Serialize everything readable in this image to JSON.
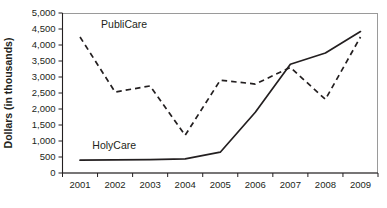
{
  "chart_data": {
    "type": "line",
    "title": "",
    "xlabel": "",
    "ylabel": "Dollars (in thousands)",
    "categories": [
      "2001",
      "2002",
      "2003",
      "2004",
      "2005",
      "2006",
      "2007",
      "2008",
      "2009"
    ],
    "ylim": [
      0,
      5000
    ],
    "yticks": [
      0,
      500,
      1000,
      1500,
      2000,
      2500,
      3000,
      3500,
      4000,
      4500,
      5000
    ],
    "ytick_labels": [
      "0",
      "500",
      "1,000",
      "1,500",
      "2,000",
      "2,500",
      "3,000",
      "3,500",
      "4,000",
      "4,500",
      "5,000"
    ],
    "grid": false,
    "legend_position": "inline-labels",
    "series": [
      {
        "name": "PubliCare",
        "style": "dashed",
        "color": "#231f20",
        "values": [
          4250,
          2530,
          2720,
          1180,
          2900,
          2780,
          3300,
          2300,
          4250
        ]
      },
      {
        "name": "HolyCare",
        "style": "solid",
        "color": "#231f20",
        "values": [
          400,
          410,
          420,
          440,
          650,
          1900,
          3400,
          3750,
          4420
        ]
      }
    ],
    "annotations": [
      {
        "text": "PubliCare",
        "x_value": "2001.6",
        "y_value": 4530
      },
      {
        "text": "HolyCare",
        "x_value": "2001.35",
        "y_value": 760
      }
    ]
  }
}
